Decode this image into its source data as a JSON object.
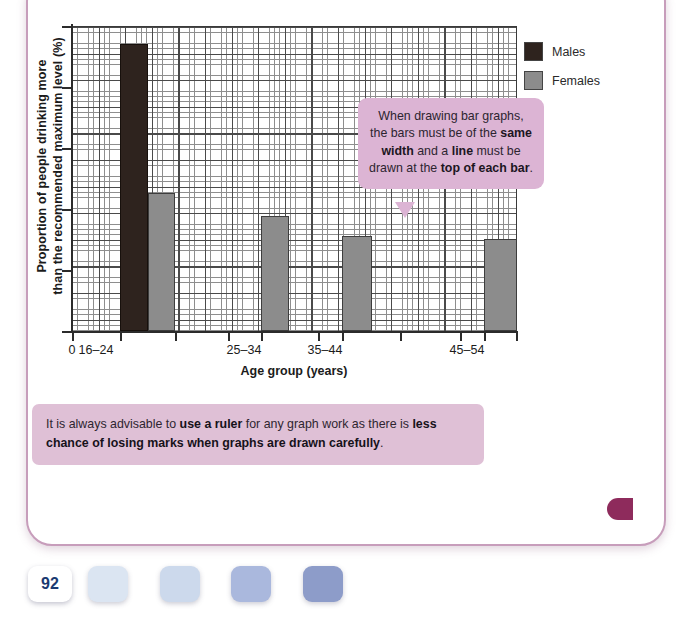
{
  "chart_data": {
    "type": "bar",
    "title": "",
    "xlabel": "Age group (years)",
    "ylabel": "Proportion of people drinking more than the recommended maximum level (%)",
    "ylabel_line1": "Proportion of people drinking more",
    "ylabel_line2": "than the recommended maximum level (%)",
    "categories": [
      "16–24",
      "25–34",
      "35–44",
      "45–54"
    ],
    "x_origin_label": "0",
    "grid": "major and minor squared graph paper",
    "legend_position": "right",
    "series": [
      {
        "name": "Males",
        "color": "#2e231e",
        "values": [
          94,
          null,
          null,
          null
        ]
      },
      {
        "name": "Females",
        "color": "#8c8c8c",
        "values": [
          45,
          38,
          31,
          30
        ]
      }
    ],
    "ylim": [
      0,
      100
    ],
    "y_major_ticks": [
      0,
      20,
      40,
      60,
      80,
      100
    ],
    "y_tick_labels": [
      "",
      "",
      "",
      "",
      "",
      ""
    ],
    "bars": [
      {
        "group": "16–24",
        "series": "Males",
        "left_px": 120,
        "width_px": 28,
        "top_px": 44,
        "value": 94
      },
      {
        "group": "16–24",
        "series": "Females",
        "left_px": 148,
        "width_px": 27,
        "top_px": 193,
        "value": 45
      },
      {
        "group": "25–34",
        "series": "Females",
        "left_px": 261,
        "width_px": 28,
        "top_px": 216,
        "value": 38
      },
      {
        "group": "35–44",
        "series": "Females",
        "left_px": 342,
        "width_px": 30,
        "top_px": 236,
        "value": 31
      },
      {
        "group": "45–54",
        "series": "Females",
        "left_px": 484,
        "width_px": 33,
        "top_px": 239,
        "value": 30
      }
    ]
  },
  "legend": {
    "items": [
      {
        "label": "Males",
        "color": "#2e231e"
      },
      {
        "label": "Females",
        "color": "#8c8c8c"
      }
    ]
  },
  "callout": {
    "text_parts": [
      {
        "t": "When drawing bar graphs, the bars must be of the ",
        "bold": false
      },
      {
        "t": "same width",
        "bold": true
      },
      {
        "t": " and a ",
        "bold": false
      },
      {
        "t": "line",
        "bold": true
      },
      {
        "t": " must be drawn at the ",
        "bold": false
      },
      {
        "t": "top of each bar",
        "bold": true
      },
      {
        "t": ".",
        "bold": false
      }
    ],
    "plain": "When drawing bar graphs, the bars must be of the same width and a line must be drawn at the top of each bar.",
    "background": "#dcb4d4"
  },
  "note": {
    "text_parts": [
      {
        "t": "It is always advisable to ",
        "bold": false
      },
      {
        "t": "use a ruler",
        "bold": true
      },
      {
        "t": " for any graph work as there is ",
        "bold": false
      },
      {
        "t": "less chance of losing marks when graphs are drawn carefully",
        "bold": true
      },
      {
        "t": ".",
        "bold": false
      }
    ],
    "plain": "It is always advisable to use a ruler for any graph work as there is less chance of losing marks when graphs are drawn carefully.",
    "background": "#dfc0d6"
  },
  "footer": {
    "page_number": "92",
    "swatches": [
      "#dbe5f2",
      "#ccd9ec",
      "#aab8dd",
      "#8d9cc9"
    ]
  },
  "page": {
    "border_color": "#c79dbb",
    "edge_tab_color": "#8e2b5c"
  }
}
